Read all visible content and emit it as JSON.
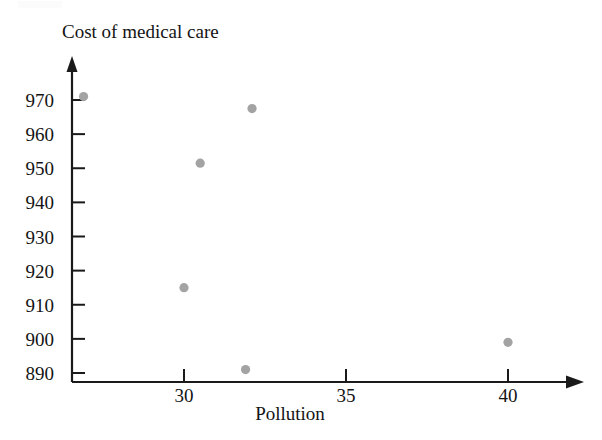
{
  "chart_data": {
    "type": "scatter",
    "title": "",
    "xlabel": "Pollution",
    "ylabel": "Cost of medical care",
    "xlim": [
      26.0,
      41.5
    ],
    "ylim": [
      887,
      977
    ],
    "grid": false,
    "legend": "none",
    "xticks": [
      30,
      35,
      40
    ],
    "yticks": [
      890,
      900,
      910,
      920,
      930,
      940,
      950,
      960,
      970
    ],
    "xtick_labels": [
      "30",
      "35",
      "40"
    ],
    "ytick_labels": [
      "890",
      "900",
      "910",
      "920",
      "930",
      "940",
      "950",
      "960",
      "970"
    ],
    "point_color": "#a3a3a3",
    "axis_color": "#1a1a1a",
    "points": [
      {
        "x": 26.9,
        "y": 971.0
      },
      {
        "x": 30.0,
        "y": 915.0
      },
      {
        "x": 30.5,
        "y": 951.5
      },
      {
        "x": 31.9,
        "y": 891.0
      },
      {
        "x": 32.1,
        "y": 967.5
      },
      {
        "x": 40.0,
        "y": 899.0
      }
    ]
  },
  "axes": {
    "y_title": "Cost of medical care",
    "x_title": "Pollution"
  }
}
